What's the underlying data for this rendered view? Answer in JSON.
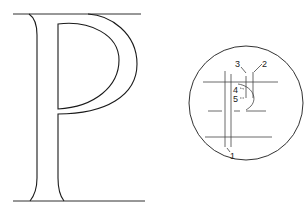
{
  "figure": {
    "letter": "P",
    "stroke_color": "#1a1a1a",
    "guide_color": "#333333",
    "background": "#ffffff"
  },
  "detail_circle": {
    "labels": [
      {
        "id": "1",
        "text": "1"
      },
      {
        "id": "2",
        "text": "2"
      },
      {
        "id": "3",
        "text": "3"
      },
      {
        "id": "4",
        "text": "4"
      },
      {
        "id": "5",
        "text": "5"
      }
    ]
  }
}
